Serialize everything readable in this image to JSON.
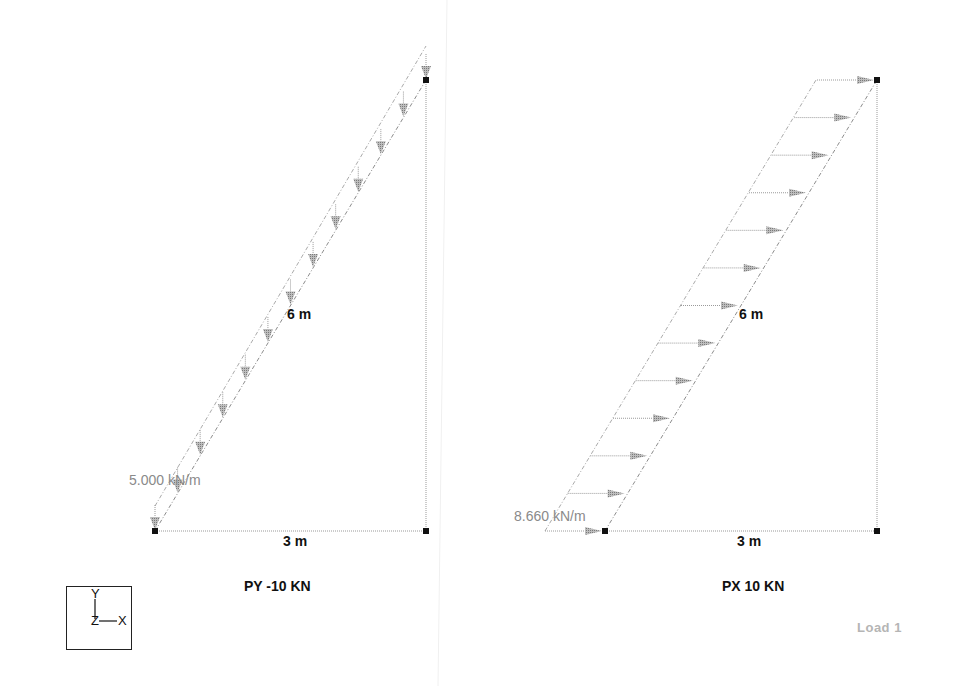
{
  "view": {
    "tag": "Load 1",
    "colors": {
      "member": "#888888",
      "load_arrow": "#9a9a9a",
      "node": "#111111",
      "text": "#111111",
      "load_text": "#8a8a8a",
      "tag_text": "#b5b5b5"
    }
  },
  "panels": [
    {
      "title": "PY -10 KN",
      "vertical_dim": "6 m",
      "horizontal_dim": "3 m",
      "load_value": "5.000 kN/m",
      "load_direction": "down",
      "arrow_count": 13
    },
    {
      "title": "PX 10 KN",
      "vertical_dim": "6 m",
      "horizontal_dim": "3 m",
      "load_value": "8.660 kN/m",
      "load_direction": "right",
      "arrow_count": 13
    }
  ],
  "axis_triad": {
    "y": "Y",
    "z": "Z",
    "x": "X"
  }
}
